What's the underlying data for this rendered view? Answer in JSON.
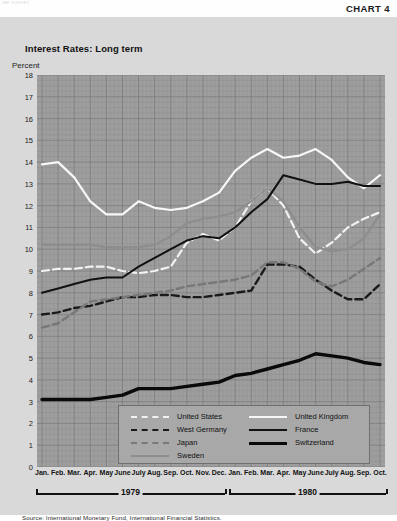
{
  "header": {
    "chart_number": "CHART 4",
    "corner_faint": "IMF SURVEY"
  },
  "title": "Interest Rates: Long term",
  "axis_unit_label": "Percent",
  "source": "Source: International Monetary Fund, International Financial Statistics.",
  "years": [
    {
      "label": "1979",
      "start_index": 0,
      "end_index": 11
    },
    {
      "label": "1980",
      "start_index": 12,
      "end_index": 21
    }
  ],
  "legend": {
    "entries": [
      {
        "label": "United States",
        "style": "dashed",
        "color": "#f2f2f2",
        "width": 2.2,
        "column": 0,
        "row": 0
      },
      {
        "label": "West Germany",
        "style": "dashed",
        "color": "#1a1a1a",
        "width": 2.4,
        "column": 0,
        "row": 1
      },
      {
        "label": "Japan",
        "style": "dashed",
        "color": "#787878",
        "width": 2.4,
        "column": 0,
        "row": 2
      },
      {
        "label": "Sweden",
        "style": "solid",
        "color": "#8d8d8d",
        "width": 2.2,
        "column": 0,
        "row": 3
      },
      {
        "label": "United Kingdom",
        "style": "solid",
        "color": "#f7f7f7",
        "width": 2.2,
        "column": 1,
        "row": 0
      },
      {
        "label": "France",
        "style": "solid",
        "color": "#111111",
        "width": 2.0,
        "column": 1,
        "row": 1
      },
      {
        "label": "Switzerland",
        "style": "solid",
        "color": "#0a0a0a",
        "width": 3.4,
        "column": 1,
        "row": 2
      }
    ]
  },
  "chart_data": {
    "type": "line",
    "title": "Interest Rates: Long term",
    "subtitle": "",
    "xlabel": "",
    "ylabel": "Percent",
    "ylim": [
      0,
      18
    ],
    "ytick_step": 1,
    "yticks": [
      0,
      1,
      2,
      3,
      4,
      5,
      6,
      7,
      8,
      9,
      10,
      11,
      12,
      13,
      14,
      15,
      16,
      17,
      18
    ],
    "grid": true,
    "legend_position": "bottom-center",
    "plot_background": "#9e9e9e",
    "x": [
      "Jan.",
      "Feb.",
      "Mar.",
      "Apr.",
      "May",
      "June",
      "July",
      "Aug.",
      "Sep.",
      "Oct.",
      "Nov.",
      "Dec.",
      "Jan.",
      "Feb.",
      "Mar.",
      "Apr.",
      "May",
      "June",
      "July",
      "Aug.",
      "Sep.",
      "Oct."
    ],
    "x_full": [
      "Jan. 1979",
      "Feb. 1979",
      "Mar. 1979",
      "Apr. 1979",
      "May 1979",
      "June 1979",
      "July 1979",
      "Aug. 1979",
      "Sep. 1979",
      "Oct. 1979",
      "Nov. 1979",
      "Dec. 1979",
      "Jan. 1980",
      "Feb. 1980",
      "Mar. 1980",
      "Apr. 1980",
      "May 1980",
      "June 1980",
      "July 1980",
      "Aug. 1980",
      "Sep. 1980",
      "Oct. 1980"
    ],
    "series": [
      {
        "name": "United Kingdom",
        "color": "#f7f7f7",
        "style": "solid",
        "width": 2.2,
        "values": [
          13.9,
          14.0,
          13.3,
          12.2,
          11.6,
          11.6,
          12.2,
          11.9,
          11.8,
          11.9,
          12.2,
          12.6,
          13.6,
          14.2,
          14.6,
          14.2,
          14.3,
          14.6,
          14.1,
          13.3,
          12.8,
          13.4
        ]
      },
      {
        "name": "United States",
        "color": "#f2f2f2",
        "style": "dashed",
        "width": 2.2,
        "values": [
          9.0,
          9.1,
          9.1,
          9.2,
          9.2,
          9.0,
          8.9,
          9.0,
          9.2,
          10.3,
          10.7,
          10.4,
          11.0,
          12.2,
          12.8,
          12.0,
          10.5,
          9.8,
          10.3,
          11.0,
          11.4,
          11.7
        ]
      },
      {
        "name": "Sweden",
        "color": "#8d8d8d",
        "style": "solid",
        "width": 2.2,
        "values": [
          10.2,
          10.2,
          10.2,
          10.2,
          10.1,
          10.1,
          10.1,
          10.2,
          10.6,
          11.2,
          11.4,
          11.5,
          11.7,
          12.2,
          12.8,
          12.2,
          11.0,
          10.1,
          9.9,
          10.0,
          10.5,
          11.6
        ]
      },
      {
        "name": "France",
        "color": "#111111",
        "style": "solid",
        "width": 2.0,
        "values": [
          8.0,
          8.2,
          8.4,
          8.6,
          8.7,
          8.7,
          9.2,
          9.6,
          10.0,
          10.4,
          10.6,
          10.5,
          11.0,
          11.7,
          12.3,
          13.4,
          13.2,
          13.0,
          13.0,
          13.1,
          12.9,
          12.9
        ]
      },
      {
        "name": "West Germany",
        "color": "#1a1a1a",
        "style": "dashed",
        "width": 2.4,
        "values": [
          7.0,
          7.1,
          7.3,
          7.4,
          7.6,
          7.8,
          7.8,
          7.9,
          7.9,
          7.8,
          7.8,
          7.9,
          8.0,
          8.1,
          9.3,
          9.3,
          9.2,
          8.6,
          8.1,
          7.7,
          7.7,
          8.4
        ]
      },
      {
        "name": "Japan",
        "color": "#787878",
        "style": "dashed",
        "width": 2.4,
        "values": [
          6.4,
          6.6,
          7.1,
          7.6,
          7.7,
          7.8,
          7.9,
          8.0,
          8.1,
          8.3,
          8.4,
          8.5,
          8.6,
          8.8,
          9.4,
          9.4,
          9.1,
          8.5,
          8.3,
          8.6,
          9.1,
          9.6
        ]
      },
      {
        "name": "Switzerland",
        "color": "#0a0a0a",
        "style": "solid",
        "width": 3.4,
        "values": [
          3.1,
          3.1,
          3.1,
          3.1,
          3.2,
          3.3,
          3.6,
          3.6,
          3.6,
          3.7,
          3.8,
          3.9,
          4.2,
          4.3,
          4.5,
          4.7,
          4.9,
          5.2,
          5.1,
          5.0,
          4.8,
          4.7
        ]
      }
    ]
  }
}
